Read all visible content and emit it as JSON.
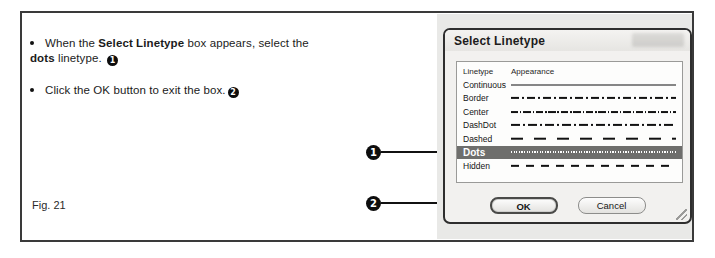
{
  "figure": {
    "caption": "Fig. 21"
  },
  "instructions": [
    {
      "pre": "When the ",
      "bold1": "Select Linetype",
      "mid": " box appears, select the ",
      "bold2": "dots",
      "post": " linetype.",
      "badge": "1"
    },
    {
      "pre": "Click the OK button to exit the box.",
      "badge": "2"
    }
  ],
  "callouts": [
    {
      "number": "1",
      "target": "dots-row"
    },
    {
      "number": "2",
      "target": "ok-button"
    }
  ],
  "dialog": {
    "title": "Select Linetype",
    "columns": {
      "name": "Linetype",
      "appearance": "Appearance"
    },
    "rows": [
      {
        "name": "Continuous",
        "pattern": "continuous",
        "selected": false
      },
      {
        "name": "Border",
        "pattern": "border",
        "selected": false
      },
      {
        "name": "Center",
        "pattern": "center",
        "selected": false
      },
      {
        "name": "DashDot",
        "pattern": "dashdot",
        "selected": false
      },
      {
        "name": "Dashed",
        "pattern": "dashed",
        "selected": false
      },
      {
        "name": "Dots",
        "pattern": "dots",
        "selected": true
      },
      {
        "name": "Hidden",
        "pattern": "hidden",
        "selected": false
      }
    ],
    "buttons": {
      "ok": "OK",
      "cancel": "Cancel"
    }
  },
  "colors": {
    "selection": "#6e6e6c",
    "frame": "#3a3a3a",
    "badge": "#0d0d0d",
    "dialog_bg": "#f2f1ef",
    "photo_bg": "#e9e9e7"
  }
}
